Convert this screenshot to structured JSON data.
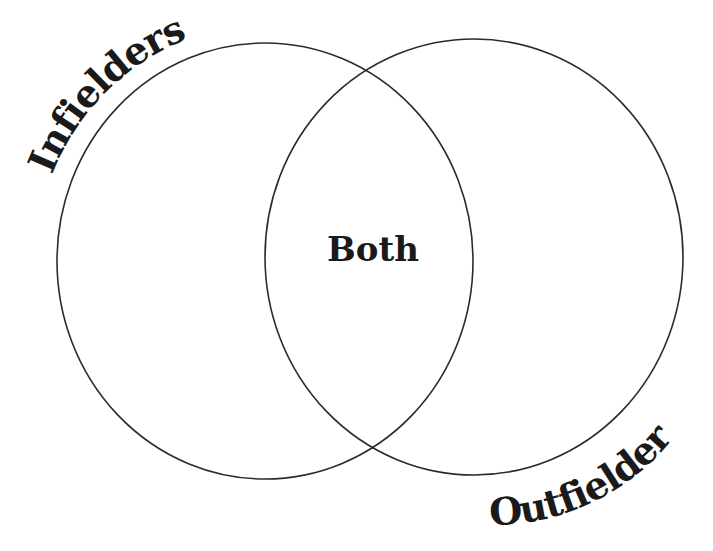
{
  "diagram": {
    "type": "venn",
    "background": "#ffffff",
    "stroke_color": "#2b2b2b",
    "text_color": "#1a1a1a",
    "sets": [
      {
        "id": "left",
        "label": "Infielders",
        "position": "upper-left, curved along circle"
      },
      {
        "id": "right",
        "label": "Outfielders",
        "position": "lower-right, curved along circle"
      }
    ],
    "intersection": {
      "label": "Both"
    }
  }
}
